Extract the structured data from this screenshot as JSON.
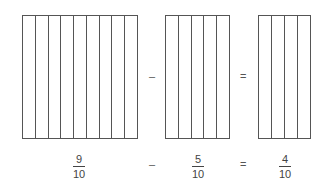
{
  "diagram": {
    "bars": [
      {
        "id": "minuend",
        "parts": 9
      },
      {
        "id": "subtrahend",
        "parts": 5
      },
      {
        "id": "difference",
        "parts": 4
      }
    ],
    "operators": {
      "minus": "–",
      "equals": "="
    },
    "fractions": [
      {
        "numerator": "9",
        "denominator": "10"
      },
      {
        "numerator": "5",
        "denominator": "10"
      },
      {
        "numerator": "4",
        "denominator": "10"
      }
    ]
  }
}
